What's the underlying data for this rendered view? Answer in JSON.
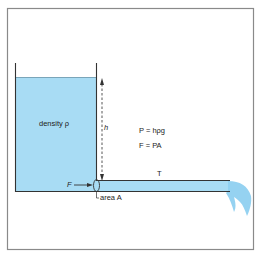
{
  "diagram": {
    "colors": {
      "water": "#a8dcf4",
      "water_jet": "#8fd0f0",
      "wall": "#333333",
      "frame": "#8a8a8a",
      "background": "#ffffff",
      "text": "#222222"
    },
    "labels": {
      "density": "density ρ",
      "height": "h",
      "pressure_eq": "P = hρg",
      "force_eq": "F = PA",
      "tap": "T",
      "force": "F",
      "area": "area A"
    },
    "elements": [
      "tank",
      "water-column",
      "height-arrow",
      "outlet-pipe",
      "water-jet",
      "force-arrow",
      "area-cross-section"
    ]
  }
}
